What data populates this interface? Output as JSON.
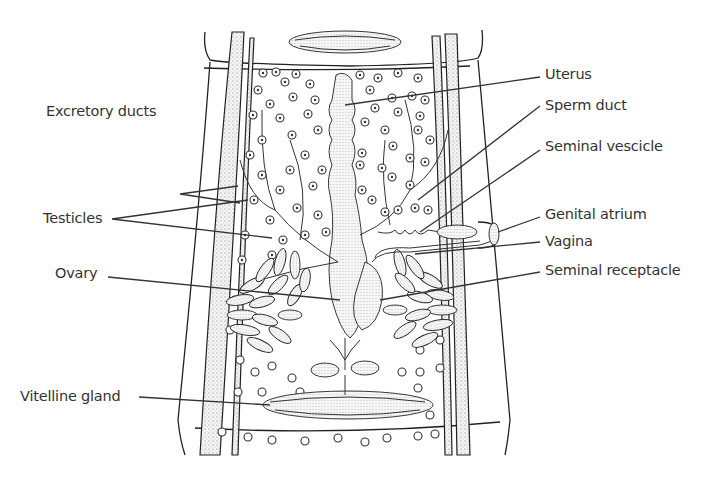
{
  "figure": {
    "labels_left": [
      {
        "id": "excretory-ducts",
        "text": "Excretory ducts"
      },
      {
        "id": "testicles",
        "text": "Testicles"
      },
      {
        "id": "ovary",
        "text": "Ovary"
      },
      {
        "id": "vitelline-gland",
        "text": "Vitelline gland"
      }
    ],
    "labels_right": [
      {
        "id": "uterus",
        "text": "Uterus"
      },
      {
        "id": "sperm-duct",
        "text": "Sperm duct"
      },
      {
        "id": "seminal-vesicle",
        "text": "Seminal vescicle"
      },
      {
        "id": "genital-atrium",
        "text": "Genital atrium"
      },
      {
        "id": "vagina",
        "text": "Vagina"
      },
      {
        "id": "seminal-receptacle",
        "text": "Seminal receptacle"
      }
    ]
  }
}
